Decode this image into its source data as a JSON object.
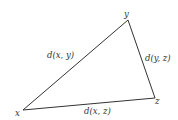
{
  "diagram": {
    "type": "triangle",
    "vertices": [
      {
        "id": "x",
        "label": "x",
        "px": 23,
        "py": 110
      },
      {
        "id": "y",
        "label": "y",
        "px": 128,
        "py": 20
      },
      {
        "id": "z",
        "label": "z",
        "px": 155,
        "py": 98
      }
    ],
    "edges": [
      {
        "from": "x",
        "to": "y",
        "label": "d(x, y)"
      },
      {
        "from": "y",
        "to": "z",
        "label": "d(y, z)"
      },
      {
        "from": "x",
        "to": "z",
        "label": "d(x, z)"
      }
    ],
    "colors": {
      "stroke": "#333333",
      "text": "#333333",
      "background": "#ffffff"
    }
  }
}
